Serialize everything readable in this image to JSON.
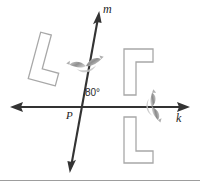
{
  "figure": {
    "type": "geometry-diagram",
    "background_color": "#ffffff",
    "line_color": "#333333",
    "shape_stroke_color": "#a6a6a6",
    "shape_fill_color": "#ffffff",
    "marker_color": "#9a9a9a"
  },
  "labels": {
    "line_m": "m",
    "line_k": "k",
    "point_p": "P",
    "angle": "80°"
  },
  "lines": [
    {
      "name": "line-k",
      "label": "k",
      "orientation": "horizontal",
      "x1": 12,
      "y1": 107,
      "x2": 188,
      "y2": 107,
      "arrows": "both"
    },
    {
      "name": "line-m",
      "label": "m",
      "orientation": "oblique",
      "x1": 70,
      "y1": 172,
      "x2": 99,
      "y2": 12,
      "arrows": "both"
    }
  ],
  "intersection": {
    "name": "point-P",
    "label": "P",
    "x": 80,
    "y": 107,
    "angle_between_lines": "80°"
  },
  "shapes": [
    {
      "name": "l-shape-upper-left",
      "position": "upper-left",
      "rotation_degrees": 195,
      "cx": 48,
      "cy": 59
    },
    {
      "name": "l-shape-upper-right",
      "position": "upper-right",
      "rotation_degrees": 0,
      "mirrored": true,
      "cx": 138,
      "cy": 72
    },
    {
      "name": "l-shape-lower-right",
      "position": "lower-right",
      "rotation_degrees": 0,
      "mirrored": false,
      "cx": 138,
      "cy": 140
    }
  ],
  "markers": [
    {
      "name": "reflection-marker-m",
      "on_line": "m",
      "x": 86,
      "y": 66
    },
    {
      "name": "reflection-marker-k",
      "on_line": "k",
      "x": 152,
      "y": 107
    }
  ],
  "divider": {
    "name": "bottom-divider",
    "y": 180,
    "color": "#9d9d9d"
  }
}
